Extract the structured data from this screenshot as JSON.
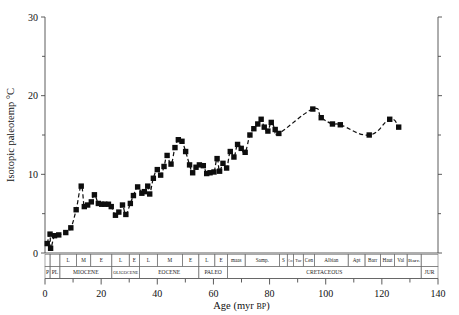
{
  "chart_data": {
    "type": "scatter",
    "title": "",
    "xlabel": "Age (myr BP)",
    "xlabel_main": "Age (myr ",
    "xlabel_smallcap": "BP",
    "xlabel_close": ")",
    "ylabel": "Isotopic paleotemp °C",
    "xlim": [
      0,
      140
    ],
    "ylim": [
      0,
      30
    ],
    "xticks": [
      0,
      20,
      40,
      60,
      80,
      100,
      120,
      140
    ],
    "xticklabels": [
      "0",
      "20",
      "40",
      "60",
      "80",
      "100",
      "120",
      "140"
    ],
    "xminorticks": [
      10,
      30,
      50,
      70,
      90,
      110,
      130
    ],
    "yticks": [
      0,
      10,
      20,
      30
    ],
    "yticklabels": [
      "0",
      "10",
      "20",
      "30"
    ],
    "yminorticks": [
      5,
      15,
      25
    ],
    "grid": false,
    "legend": null,
    "series": [
      {
        "name": "Isotopic paleotemperature",
        "marker": "filled-square",
        "line": "dashed-smooth",
        "points": [
          [
            0.8,
            1.2
          ],
          [
            1.8,
            2.4
          ],
          [
            2.0,
            0.6
          ],
          [
            3.4,
            2.2
          ],
          [
            4.9,
            2.3
          ],
          [
            7.4,
            2.6
          ],
          [
            9.2,
            3.2
          ],
          [
            11.1,
            5.5
          ],
          [
            12.9,
            8.5
          ],
          [
            14.0,
            5.9
          ],
          [
            15.2,
            6.1
          ],
          [
            16.5,
            6.5
          ],
          [
            17.6,
            7.4
          ],
          [
            19.0,
            6.3
          ],
          [
            20.2,
            6.2
          ],
          [
            21.3,
            6.2
          ],
          [
            22.6,
            6.2
          ],
          [
            23.6,
            5.9
          ],
          [
            25.1,
            4.8
          ],
          [
            26.3,
            5.2
          ],
          [
            27.6,
            6.1
          ],
          [
            28.8,
            4.9
          ],
          [
            30.4,
            6.3
          ],
          [
            31.5,
            7.3
          ],
          [
            33.0,
            8.4
          ],
          [
            34.5,
            7.6
          ],
          [
            35.4,
            7.8
          ],
          [
            36.6,
            8.5
          ],
          [
            37.3,
            7.5
          ],
          [
            38.6,
            9.5
          ],
          [
            40.0,
            10.6
          ],
          [
            41.2,
            9.9
          ],
          [
            42.4,
            11.0
          ],
          [
            43.5,
            12.4
          ],
          [
            44.9,
            11.3
          ],
          [
            46.3,
            13.4
          ],
          [
            47.5,
            14.4
          ],
          [
            48.8,
            14.2
          ],
          [
            50.1,
            12.9
          ],
          [
            51.5,
            11.2
          ],
          [
            52.6,
            10.2
          ],
          [
            53.8,
            10.9
          ],
          [
            55.0,
            11.2
          ],
          [
            56.4,
            11.1
          ],
          [
            57.6,
            10.1
          ],
          [
            58.8,
            10.2
          ],
          [
            60.2,
            10.3
          ],
          [
            61.3,
            12.0
          ],
          [
            62.2,
            10.4
          ],
          [
            63.4,
            11.4
          ],
          [
            64.7,
            10.8
          ],
          [
            66.0,
            12.9
          ],
          [
            67.3,
            12.2
          ],
          [
            68.6,
            13.8
          ],
          [
            69.9,
            13.3
          ],
          [
            71.3,
            12.8
          ],
          [
            73.0,
            15.0
          ],
          [
            74.4,
            15.8
          ],
          [
            75.8,
            16.4
          ],
          [
            77.0,
            17.0
          ],
          [
            78.1,
            16.0
          ],
          [
            79.4,
            15.5
          ],
          [
            80.6,
            16.6
          ],
          [
            82.0,
            15.7
          ],
          [
            83.3,
            15.2
          ],
          [
            95.4,
            18.3
          ],
          [
            98.4,
            17.2
          ],
          [
            102.4,
            16.4
          ],
          [
            105.2,
            16.3
          ],
          [
            115.5,
            15.0
          ],
          [
            122.8,
            17.0
          ],
          [
            126.0,
            16.0
          ]
        ]
      }
    ],
    "timescale": {
      "rows": [
        {
          "name": "epoch-subdivisions",
          "cells": [
            {
              "label": "",
              "start": 0.0,
              "end": 1.8
            },
            {
              "label": "",
              "start": 1.8,
              "end": 5.3
            },
            {
              "label": "L",
              "start": 5.3,
              "end": 11.2
            },
            {
              "label": "M",
              "start": 11.2,
              "end": 16.3
            },
            {
              "label": "E",
              "start": 16.3,
              "end": 23.8
            },
            {
              "label": "L",
              "start": 23.8,
              "end": 30.0
            },
            {
              "label": "E",
              "start": 30.0,
              "end": 33.7
            },
            {
              "label": "L",
              "start": 33.7,
              "end": 40.0
            },
            {
              "label": "M",
              "start": 40.0,
              "end": 49.0
            },
            {
              "label": "E",
              "start": 49.0,
              "end": 54.8
            },
            {
              "label": "L",
              "start": 54.8,
              "end": 60.5
            },
            {
              "label": "E",
              "start": 60.5,
              "end": 65.0
            },
            {
              "label": "maas",
              "start": 65.0,
              "end": 71.3
            },
            {
              "label": "Samp.",
              "start": 71.3,
              "end": 83.5
            },
            {
              "label": "S",
              "start": 83.5,
              "end": 86.3
            },
            {
              "label": "Con",
              "start": 86.3,
              "end": 88.5
            },
            {
              "label": "Tur",
              "start": 88.5,
              "end": 92.0
            },
            {
              "label": "Cen",
              "start": 92.0,
              "end": 96.0
            },
            {
              "label": "Albian",
              "start": 96.0,
              "end": 108.0
            },
            {
              "label": "Apt",
              "start": 108.0,
              "end": 114.0
            },
            {
              "label": "Barr",
              "start": 114.0,
              "end": 119.5
            },
            {
              "label": "Haut",
              "start": 119.5,
              "end": 124.5
            },
            {
              "label": "Val",
              "start": 124.5,
              "end": 129.0
            },
            {
              "label": "Barr.",
              "start": 129.0,
              "end": 134.0
            },
            {
              "label": "",
              "start": 134.0,
              "end": 140.0
            }
          ]
        },
        {
          "name": "periods-epochs",
          "cells": [
            {
              "label": "P",
              "start": 0.0,
              "end": 1.8
            },
            {
              "label": "PL",
              "start": 1.8,
              "end": 5.3
            },
            {
              "label": "MIOCENE",
              "start": 5.3,
              "end": 23.8
            },
            {
              "label": "OLIGOCENE",
              "start": 23.8,
              "end": 33.7
            },
            {
              "label": "EOCENE",
              "start": 33.7,
              "end": 54.8
            },
            {
              "label": "PALEO",
              "start": 54.8,
              "end": 65.0
            },
            {
              "label": "CRETACEOUS",
              "start": 65.0,
              "end": 134.0
            },
            {
              "label": "JUR",
              "start": 134.0,
              "end": 140.0
            }
          ]
        }
      ]
    }
  },
  "figure": {
    "axis_color": "#4a4a4a",
    "marker_color": "#0d0d0d",
    "line_color": "#111111",
    "background": "#ffffff"
  }
}
